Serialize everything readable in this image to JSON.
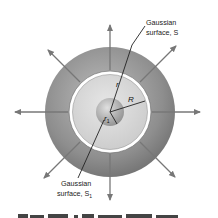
{
  "figure": {
    "labels": {
      "surface_s_line1": "Gaussian",
      "surface_s_line2": "surface, S",
      "surface_s1_line1": "Gaussian",
      "surface_s1_line2": "surface, S",
      "surface_s1_sub": "1",
      "radius_r": "r",
      "radius_R": "R",
      "radius_r1": "r",
      "radius_r1_sub": "1"
    },
    "caption_partial": "Figure 16.??  ...",
    "colors": {
      "outer_sphere": "#8a8a8a",
      "inner_region": "#d8d8d8",
      "ring": "#ffffff",
      "core": "#b0b0b0",
      "arrow": "#777777",
      "line": "#222222"
    }
  }
}
